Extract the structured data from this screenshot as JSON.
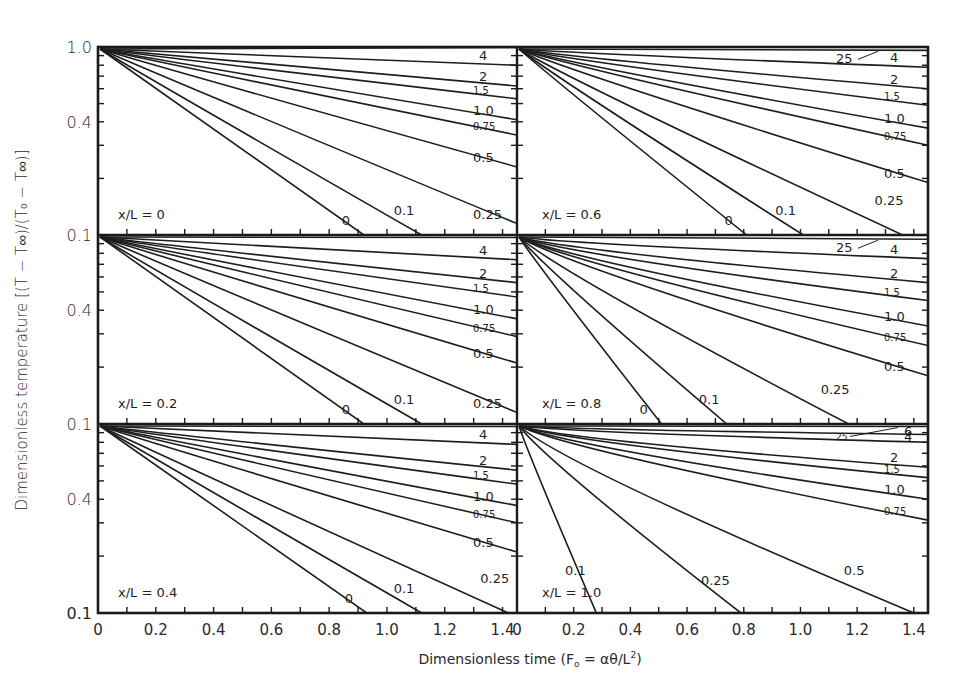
{
  "figure": {
    "y_axis_title": "Dimensionless temperature [(T − T∞)/(T₀ − T∞)]",
    "x_axis_title_prefix": "Dimensionless time (F",
    "x_axis_title_sub": "o",
    "x_axis_title_mid": " = αθ/L",
    "x_axis_title_sup": "2",
    "x_axis_title_suffix": ")",
    "line_color": "#1e1e1e",
    "frame_color": "#1a1a1a",
    "background": "#ffffff"
  },
  "chart_data": {
    "type": "line",
    "title": "",
    "xlabel": "Dimensionless time (Fo = αθ/L²)",
    "ylabel": "Dimensionless temperature [(T − T∞)/(T₀ − T∞)]",
    "yscale": "log",
    "ylim": [
      0.1,
      1.0
    ],
    "xlim": [
      0,
      1.45
    ],
    "y_tick_labels": [
      "1.0",
      "0.4",
      "0.1"
    ],
    "x_tick_labels": [
      "0",
      "0.2",
      "0.4",
      "0.6",
      "0.8",
      "1.0",
      "1.2",
      "1.4"
    ],
    "legend_note": "Curve labels denote Biot number (hL/k)",
    "panels": [
      {
        "id": "xL-0",
        "label": "x/L = 0",
        "row": 0,
        "col": 0,
        "series": [
          {
            "name": "25",
            "show_label": false,
            "end_x": 1.45,
            "end_y": 0.995
          },
          {
            "name": "4",
            "end_x": 1.45,
            "end_y": 0.8
          },
          {
            "name": "2",
            "end_x": 1.45,
            "end_y": 0.62
          },
          {
            "name": "1.5",
            "end_x": 1.45,
            "end_y": 0.53
          },
          {
            "name": "1.0",
            "end_x": 1.45,
            "end_y": 0.41
          },
          {
            "name": "0.75",
            "end_x": 1.45,
            "end_y": 0.34
          },
          {
            "name": "0.5",
            "end_x": 1.45,
            "end_y": 0.23
          },
          {
            "name": "0.25",
            "end_x": 1.45,
            "end_y": 0.115
          },
          {
            "name": "0.1",
            "end_x": 1.12,
            "end_y": 0.1
          },
          {
            "name": "0",
            "end_x": 0.92,
            "end_y": 0.1
          }
        ]
      },
      {
        "id": "xL-0.6",
        "label": "x/L = 0.6",
        "row": 0,
        "col": 1,
        "series": [
          {
            "name": "25",
            "end_x": 1.45,
            "end_y": 0.96
          },
          {
            "name": "4",
            "end_x": 1.45,
            "end_y": 0.78
          },
          {
            "name": "2",
            "end_x": 1.45,
            "end_y": 0.6
          },
          {
            "name": "1.5",
            "end_x": 1.45,
            "end_y": 0.49
          },
          {
            "name": "1.0",
            "end_x": 1.45,
            "end_y": 0.37
          },
          {
            "name": "0.75",
            "end_x": 1.45,
            "end_y": 0.3
          },
          {
            "name": "0.5",
            "end_x": 1.45,
            "end_y": 0.19
          },
          {
            "name": "0.25",
            "end_x": 1.36,
            "end_y": 0.1
          },
          {
            "name": "0.1",
            "end_x": 1.01,
            "end_y": 0.1
          },
          {
            "name": "0",
            "end_x": 0.81,
            "end_y": 0.1
          }
        ]
      },
      {
        "id": "xL-0.2",
        "label": "x/L = 0.2",
        "row": 1,
        "col": 0,
        "series": [
          {
            "name": "25",
            "show_label": false,
            "end_x": 1.45,
            "end_y": 0.97
          },
          {
            "name": "4",
            "end_x": 1.45,
            "end_y": 0.74
          },
          {
            "name": "2",
            "end_x": 1.45,
            "end_y": 0.56
          },
          {
            "name": "1.5",
            "end_x": 1.45,
            "end_y": 0.47
          },
          {
            "name": "1.0",
            "end_x": 1.45,
            "end_y": 0.36
          },
          {
            "name": "0.75",
            "end_x": 1.45,
            "end_y": 0.29
          },
          {
            "name": "0.5",
            "end_x": 1.45,
            "end_y": 0.21
          },
          {
            "name": "0.25",
            "end_x": 1.45,
            "end_y": 0.115
          },
          {
            "name": "0.1",
            "end_x": 1.12,
            "end_y": 0.1
          },
          {
            "name": "0",
            "end_x": 0.92,
            "end_y": 0.1
          }
        ]
      },
      {
        "id": "xL-0.8",
        "label": "x/L = 0.8",
        "row": 1,
        "col": 1,
        "series": [
          {
            "name": "25",
            "end_x": 1.45,
            "end_y": 0.95
          },
          {
            "name": "4",
            "end_x": 1.45,
            "end_y": 0.75
          },
          {
            "name": "2",
            "end_x": 1.45,
            "end_y": 0.56
          },
          {
            "name": "1.5",
            "end_x": 1.45,
            "end_y": 0.45
          },
          {
            "name": "1.0",
            "end_x": 1.45,
            "end_y": 0.33
          },
          {
            "name": "0.75",
            "end_x": 1.45,
            "end_y": 0.26
          },
          {
            "name": "0.5",
            "end_x": 1.45,
            "end_y": 0.18
          },
          {
            "name": "0.25",
            "end_x": 1.17,
            "end_y": 0.1
          },
          {
            "name": "0.1",
            "end_x": 0.74,
            "end_y": 0.1
          },
          {
            "name": "0",
            "end_x": 0.51,
            "end_y": 0.1
          }
        ]
      },
      {
        "id": "xL-0.4",
        "label": "x/L = 0.4",
        "row": 2,
        "col": 0,
        "series": [
          {
            "name": "25",
            "show_label": false,
            "end_x": 1.45,
            "end_y": 0.97
          },
          {
            "name": "4",
            "end_x": 1.45,
            "end_y": 0.78
          },
          {
            "name": "2",
            "end_x": 1.45,
            "end_y": 0.57
          },
          {
            "name": "1.5",
            "end_x": 1.45,
            "end_y": 0.48
          },
          {
            "name": "1.0",
            "end_x": 1.45,
            "end_y": 0.37
          },
          {
            "name": "0.75",
            "end_x": 1.45,
            "end_y": 0.3
          },
          {
            "name": "0.5",
            "end_x": 1.45,
            "end_y": 0.21
          },
          {
            "name": "0.25",
            "end_x": 1.42,
            "end_y": 0.1
          },
          {
            "name": "0.1",
            "end_x": 1.12,
            "end_y": 0.1
          },
          {
            "name": "0",
            "end_x": 0.93,
            "end_y": 0.1
          }
        ]
      },
      {
        "id": "xL-1.0",
        "label": "x/L = 1.0",
        "row": 2,
        "col": 1,
        "series": [
          {
            "name": "25",
            "end_x": 1.45,
            "end_y": 0.97
          },
          {
            "name": "6",
            "end_x": 1.45,
            "end_y": 0.88
          },
          {
            "name": "4",
            "end_x": 1.45,
            "end_y": 0.8
          },
          {
            "name": "2",
            "end_x": 1.45,
            "end_y": 0.59
          },
          {
            "name": "1.5",
            "end_x": 1.45,
            "end_y": 0.52
          },
          {
            "name": "1.0",
            "end_x": 1.45,
            "end_y": 0.4
          },
          {
            "name": "0.75",
            "end_x": 1.45,
            "end_y": 0.31
          },
          {
            "name": "0.5",
            "end_x": 1.4,
            "end_y": 0.1
          },
          {
            "name": "0.25",
            "end_x": 0.79,
            "end_y": 0.1
          },
          {
            "name": "0.1",
            "end_x": 0.28,
            "end_y": 0.1
          }
        ]
      }
    ]
  }
}
